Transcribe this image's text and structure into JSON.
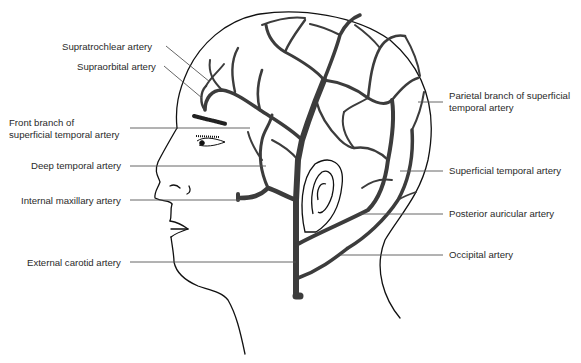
{
  "diagram": {
    "colors": {
      "outline": "#111111",
      "artery": "#3c3c3c",
      "leader": "#555555",
      "text": "#2a2a2a",
      "background": "#ffffff"
    },
    "labels_left": [
      {
        "id": "supratrochlear",
        "text": "Supratrochlear artery"
      },
      {
        "id": "supraorbital",
        "text": "Supraorbital artery"
      },
      {
        "id": "front-branch-1",
        "text": "Front branch of"
      },
      {
        "id": "front-branch-2",
        "text": "superficial temporal artery"
      },
      {
        "id": "deep-temporal",
        "text": "Deep temporal artery"
      },
      {
        "id": "internal-maxillary",
        "text": "Internal maxillary artery"
      },
      {
        "id": "external-carotid",
        "text": "External carotid artery"
      }
    ],
    "labels_right": [
      {
        "id": "parietal-branch-1",
        "text": "Parietal branch of superficial"
      },
      {
        "id": "parietal-branch-2",
        "text": "temporal artery"
      },
      {
        "id": "superficial-temporal",
        "text": "Superficial temporal artery"
      },
      {
        "id": "posterior-auricular",
        "text": "Posterior auricular artery"
      },
      {
        "id": "occipital",
        "text": "Occipital artery"
      }
    ]
  }
}
